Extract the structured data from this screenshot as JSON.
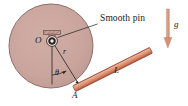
{
  "figure": {
    "name": "pinned-disk-with-rod-diagram",
    "width": 188,
    "height": 106,
    "background": "#ffffff"
  },
  "colors": {
    "disk_fill": "#c9a59d",
    "disk_stroke": "#8d6f68",
    "rod_light": "#e09a7e",
    "rod_mid": "#d4795c",
    "rod_dark": "#a85236",
    "arrow": "#d98f72",
    "line": "#2b2b2b",
    "pin_dark": "#1a1a1a",
    "pin_light": "#f2e3de",
    "bracket": "#b99089",
    "text": "#1a1a1a"
  },
  "disk": {
    "label": "disk",
    "cx": 51,
    "cy": 46,
    "r": 42
  },
  "pin": {
    "label": "pin",
    "cx": 52,
    "cy": 41,
    "outer_r": 5.2,
    "mid_r": 3.4,
    "inner_r": 1.7,
    "bracket_width": 17,
    "bracket_height": 4
  },
  "labels": {
    "smooth_pin": "Smooth pin",
    "center_O": "O",
    "radius_r": "r",
    "angle_theta": "θ",
    "point_A": "A",
    "rod_L": "L",
    "gravity_g": "g"
  },
  "geometry": {
    "center_O": {
      "x": 52,
      "y": 41
    },
    "point_A": {
      "x": 79,
      "y": 85
    },
    "vertical_end": {
      "x": 52,
      "y": 84
    },
    "callout_leader_start": {
      "x": 57,
      "y": 37
    },
    "callout_leader_end": {
      "x": 98,
      "y": 24
    },
    "rod_start": {
      "x": 76,
      "y": 88
    },
    "rod_end": {
      "x": 152,
      "y": 50
    },
    "rod_thickness": 6,
    "gravity_arrow": {
      "x": 168,
      "y_top": 10,
      "y_bottom": 47
    }
  },
  "label_positions": {
    "smooth_pin": {
      "x": 100,
      "y": 19
    },
    "center_O": {
      "x": 37,
      "y": 37
    },
    "radius_r": {
      "x": 64,
      "y": 52
    },
    "angle_theta": {
      "x": 56,
      "y": 72
    },
    "point_A": {
      "x": 73,
      "y": 93
    },
    "rod_L": {
      "x": 116,
      "y": 71
    },
    "gravity_g": {
      "x": 174,
      "y": 25
    }
  }
}
